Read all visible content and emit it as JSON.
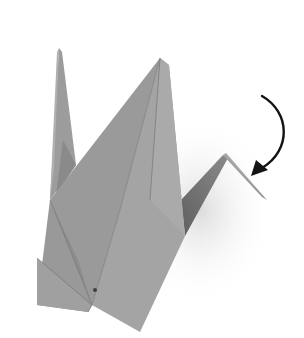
{
  "figure": {
    "subject": "Origami crane, fold the head down"
  },
  "icons": {
    "arrow": "curved-arrow-down-left"
  },
  "colors": {
    "background": "#ffffff",
    "paper_light": "#a3a3a3",
    "paper_mid": "#979797",
    "paper_dark": "#858585",
    "paper_shadow": "#6f6f6f",
    "crease": "#5a5a5a",
    "arrow": "#141414"
  }
}
